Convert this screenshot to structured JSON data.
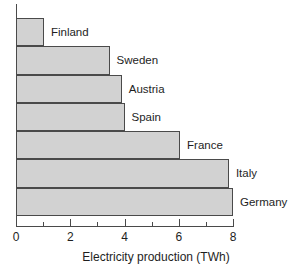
{
  "chart_data": {
    "type": "bar",
    "orientation": "horizontal",
    "title": "",
    "xlabel": "Electricity production (TWh)",
    "ylabel": "",
    "categories": [
      "Finland",
      "Sweden",
      "Austria",
      "Spain",
      "France",
      "Italy",
      "Germany"
    ],
    "values": [
      1.03,
      3.45,
      3.9,
      4.0,
      6.05,
      7.85,
      8.0
    ],
    "xlim": [
      0,
      8
    ],
    "xticks": [
      0,
      2,
      4,
      6,
      8
    ],
    "xtick_labels": [
      "0",
      "2",
      "4",
      "6",
      "8"
    ],
    "xminor_ticks": [
      1,
      3,
      5,
      7
    ],
    "grid": false,
    "legend": false,
    "bar_fill_color": "#d2d2d2",
    "bar_edge_color": "#4a4a4a",
    "axis_color": "#4a4a4a"
  },
  "bars": [
    {
      "label": "Finland",
      "value": 1.03
    },
    {
      "label": "Sweden",
      "value": 3.45
    },
    {
      "label": "Austria",
      "value": 3.9
    },
    {
      "label": "Spain",
      "value": 4.0
    },
    {
      "label": "France",
      "value": 6.05
    },
    {
      "label": "Italy",
      "value": 7.85
    },
    {
      "label": "Germany",
      "value": 8.0
    }
  ],
  "axis": {
    "x_title": "Electricity production (TWh)",
    "ticks": [
      {
        "value": 0,
        "label": "0"
      },
      {
        "value": 2,
        "label": "2"
      },
      {
        "value": 4,
        "label": "4"
      },
      {
        "value": 6,
        "label": "6"
      },
      {
        "value": 8,
        "label": "8"
      }
    ],
    "minor_ticks": [
      1,
      3,
      5,
      7
    ]
  }
}
